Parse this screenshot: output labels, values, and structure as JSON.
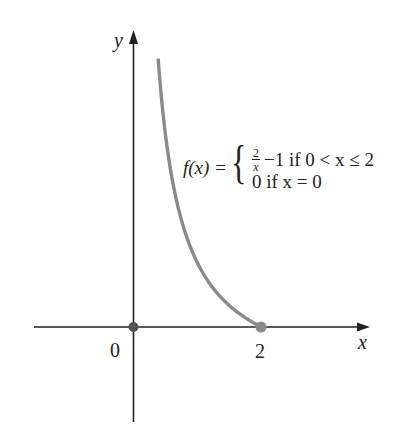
{
  "chart_data": {
    "type": "line",
    "title": "",
    "xlabel": "x",
    "ylabel": "y",
    "x_ticks": [
      {
        "value": 0,
        "label": "0"
      },
      {
        "value": 2,
        "label": "2"
      }
    ],
    "y_ticks": [],
    "xlim": [
      -1.55,
      3.7
    ],
    "ylim": [
      -1.5,
      4.6
    ],
    "grid": false,
    "legend": null,
    "series": [
      {
        "name": "f(x) = 2/x - 1 for 0 < x <= 2",
        "function": "2/x - 1",
        "domain": [
          0.385,
          2
        ],
        "color": "#8a8a8a",
        "x": [
          0.385,
          0.4,
          0.5,
          0.6,
          0.75,
          1.0,
          1.25,
          1.5,
          1.75,
          2.0
        ],
        "y": [
          4.19,
          4.0,
          3.0,
          2.33,
          1.67,
          1.0,
          0.6,
          0.33,
          0.14,
          0.0
        ]
      }
    ],
    "points": [
      {
        "x": 0,
        "y": 0,
        "label": "f(0) = 0",
        "color": "#555555",
        "filled": true
      },
      {
        "x": 2,
        "y": 0,
        "label": "f(2) = 0",
        "color": "#8a8a8a",
        "filled": true
      }
    ],
    "annotations": [
      {
        "text": "f(x) = { 2/x − 1 if 0 < x ≤ 2 ; 0 if x = 0 }",
        "lhs": "f(x) =",
        "cases": [
          {
            "expr_num": "2",
            "expr_den": "x",
            "expr_rest": "−1 if 0 < x ≤ 2"
          },
          {
            "expr": "0 if x = 0"
          }
        ]
      }
    ]
  },
  "labels": {
    "y_axis": "y",
    "x_axis": "x",
    "origin": "0",
    "tick_2": "2"
  },
  "formula": {
    "lhs": "f(x) =",
    "brace": "{",
    "case1_num": "2",
    "case1_den": "x",
    "case1_rest": "−1 if 0 < x ≤ 2",
    "case2": "0 if x = 0"
  },
  "colors": {
    "axis": "#222222",
    "curve": "#8a8a8a",
    "origin_point": "#555555",
    "end_point": "#8a8a8a"
  }
}
